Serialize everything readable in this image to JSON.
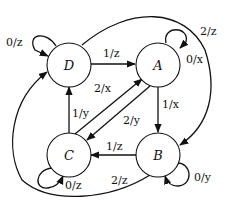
{
  "diagram": {
    "type": "state-machine",
    "nodes": [
      {
        "id": "D",
        "label": "D"
      },
      {
        "id": "A",
        "label": "A"
      },
      {
        "id": "C",
        "label": "C"
      },
      {
        "id": "B",
        "label": "B"
      }
    ],
    "edges": [
      {
        "from": "D",
        "to": "D",
        "input": "0",
        "output": "z",
        "label": "0/z"
      },
      {
        "from": "D",
        "to": "A",
        "input": "1",
        "output": "z",
        "label": "1/z"
      },
      {
        "from": "A",
        "to": "A",
        "input": "0",
        "output": "x",
        "label": "0/x"
      },
      {
        "from": "D",
        "to": "B",
        "input": "2",
        "output": "z",
        "label": "2/z"
      },
      {
        "from": "A",
        "to": "B",
        "input": "1",
        "output": "x",
        "label": "1/x"
      },
      {
        "from": "C",
        "to": "A",
        "input": "2",
        "output": "x",
        "label": "2/x"
      },
      {
        "from": "A",
        "to": "C",
        "input": "2",
        "output": "y",
        "label": "2/y"
      },
      {
        "from": "C",
        "to": "D",
        "input": "1",
        "output": "y",
        "label": "1/y"
      },
      {
        "from": "B",
        "to": "C",
        "input": "1",
        "output": "z",
        "label": "1/z"
      },
      {
        "from": "C",
        "to": "C",
        "input": "0",
        "output": "z",
        "label": "0/z"
      },
      {
        "from": "B",
        "to": "B",
        "input": "0",
        "output": "y",
        "label": "0/y"
      },
      {
        "from": "B",
        "to": "D",
        "input": "2",
        "output": "z",
        "label": "2/z"
      }
    ]
  }
}
